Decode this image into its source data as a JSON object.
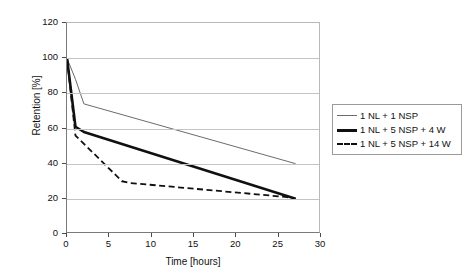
{
  "chart_data": {
    "type": "line",
    "title": "",
    "xlabel": "Time [hours]",
    "ylabel": "Retention [%]",
    "xlim": [
      0,
      30
    ],
    "ylim": [
      0,
      120
    ],
    "xticks": [
      0,
      5,
      10,
      15,
      20,
      25,
      30
    ],
    "yticks": [
      0,
      20,
      40,
      60,
      80,
      100,
      120
    ],
    "grid": "horizontal",
    "legend_position": "right",
    "series": [
      {
        "name": "1 NL + 1 NSP",
        "style": "thin-solid",
        "color": "#6b6b6b",
        "x": [
          0,
          1,
          2,
          27
        ],
        "y": [
          100,
          88,
          74,
          40
        ]
      },
      {
        "name": "1 NL + 5 NSP + 4 W",
        "style": "bold-solid",
        "color": "#101010",
        "x": [
          0,
          1,
          2,
          27
        ],
        "y": [
          100,
          61,
          58,
          20
        ]
      },
      {
        "name": "1 NL + 5 NSP + 14 W",
        "style": "dashed",
        "color": "#101010",
        "x": [
          0,
          1,
          6.5,
          7.5,
          26,
          27
        ],
        "y": [
          100,
          56,
          30,
          29,
          21,
          20
        ]
      }
    ]
  },
  "axes": {
    "y_title": "Retention [%]",
    "x_title": "Time [hours]",
    "y_tick_labels": [
      "120",
      "100",
      "80",
      "60",
      "40",
      "20",
      "0"
    ],
    "x_tick_labels": [
      "0",
      "5",
      "10",
      "15",
      "20",
      "25",
      "30"
    ]
  },
  "legend": {
    "items": [
      {
        "label": "1 NL + 1 NSP"
      },
      {
        "label": "1 NL + 5 NSP + 4 W"
      },
      {
        "label": "1 NL + 5 NSP + 14 W"
      }
    ]
  },
  "colors": {
    "series_thin": "#6b6b6b",
    "series_bold": "#101010",
    "series_dashed": "#101010",
    "gridline": "#c4c4c4",
    "axis": "#7a7a7a",
    "background": "#ffffff"
  }
}
